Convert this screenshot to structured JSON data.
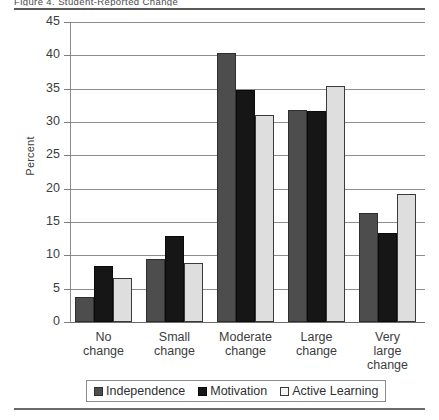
{
  "figure": {
    "title_clipped": "Figure 4. Student-Reported Change",
    "ylabel": "Percent"
  },
  "chart_data": {
    "type": "bar",
    "title": "",
    "xlabel": "",
    "ylabel": "Percent",
    "ylim": [
      0,
      45
    ],
    "ytick_step": 5,
    "yticks": [
      0,
      5,
      10,
      15,
      20,
      25,
      30,
      35,
      40,
      45
    ],
    "ytick_labels": [
      "0",
      "5",
      "10",
      "15",
      "20",
      "25",
      "30",
      "35",
      "40",
      "45"
    ],
    "grid": true,
    "legend_position": "bottom",
    "categories": [
      "No change",
      "Small change",
      "Moderate change",
      "Large change",
      "Very large change"
    ],
    "category_lines": [
      [
        "No",
        "change"
      ],
      [
        "Small",
        "change"
      ],
      [
        "Moderate",
        "change"
      ],
      [
        "Large",
        "change"
      ],
      [
        "Very",
        "large",
        "change"
      ]
    ],
    "series": [
      {
        "name": "Independence",
        "color": "#4d4d4d",
        "values": [
          3.8,
          9.5,
          40.3,
          31.8,
          16.4
        ]
      },
      {
        "name": "Motivation",
        "color": "#161616",
        "values": [
          8.4,
          12.9,
          34.8,
          31.7,
          13.3
        ]
      },
      {
        "name": "Active Learning",
        "color": "#dedede",
        "values": [
          6.6,
          8.9,
          31.1,
          35.4,
          19.2
        ]
      }
    ]
  },
  "legend": {
    "items": [
      {
        "label": "Independence"
      },
      {
        "label": "Motivation"
      },
      {
        "label": "Active Learning"
      }
    ]
  }
}
